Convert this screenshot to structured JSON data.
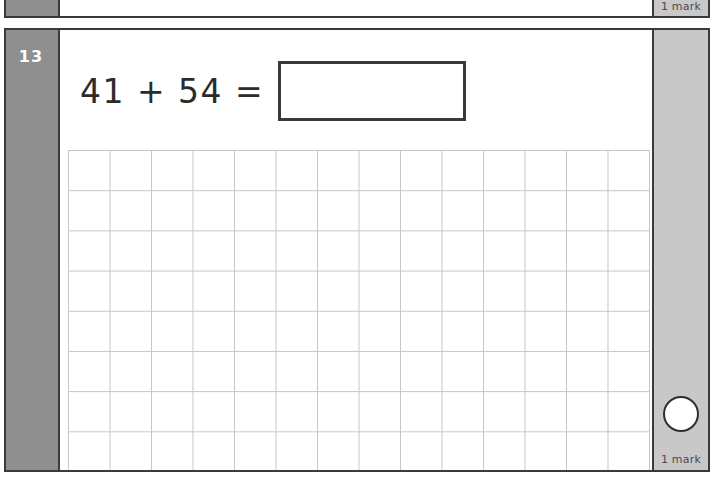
{
  "page": {
    "background_color": "#ffffff",
    "border_color": "#3a3a3a"
  },
  "previous_question": {
    "mark_label": "1 mark",
    "number_rail_color": "#8f8f8f",
    "mark_rail_color": "#c8c8c8"
  },
  "question": {
    "number": "13",
    "equation": "41 + 54 =",
    "answer_value": "",
    "answer_placeholder": "",
    "mark_label": "1 mark",
    "mark_circle_name": "mark-circle",
    "number_rail_color": "#8f8f8f",
    "mark_rail_color": "#c8c8c8",
    "grid": {
      "columns": 14,
      "rows": 8,
      "cell_width": 41.5,
      "cell_height": 40.2,
      "line_color": "#c6c6c6"
    }
  }
}
